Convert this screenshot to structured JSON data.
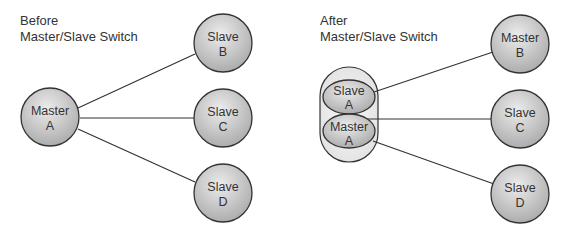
{
  "before": {
    "caption_line1": "Before",
    "caption_line2": "Master/Slave Switch",
    "nodes": [
      {
        "id": "A",
        "role": "Master",
        "letter": "A"
      },
      {
        "id": "B",
        "role": "Slave",
        "letter": "B"
      },
      {
        "id": "C",
        "role": "Slave",
        "letter": "C"
      },
      {
        "id": "D",
        "role": "Slave",
        "letter": "D"
      }
    ],
    "edges": [
      [
        "A",
        "B"
      ],
      [
        "A",
        "C"
      ],
      [
        "A",
        "D"
      ]
    ]
  },
  "after": {
    "caption_line1": "After",
    "caption_line2": "Master/Slave Switch",
    "group": {
      "slave": {
        "role": "Slave",
        "letter": "A"
      },
      "master": {
        "role": "Master",
        "letter": "A"
      }
    },
    "nodes": [
      {
        "id": "B",
        "role": "Master",
        "letter": "B"
      },
      {
        "id": "C",
        "role": "Slave",
        "letter": "C"
      },
      {
        "id": "D",
        "role": "Slave",
        "letter": "D"
      }
    ],
    "edges": [
      [
        "Slave A",
        "B"
      ],
      [
        "Master A",
        "C"
      ],
      [
        "Master A",
        "D"
      ]
    ]
  },
  "colors": {
    "node_fill_light": "#ececec",
    "node_fill_dark": "#a8a8a8",
    "stroke": "#333333",
    "text": "#333333"
  }
}
